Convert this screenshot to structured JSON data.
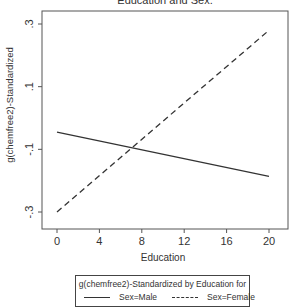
{
  "chart_data": {
    "type": "line",
    "title": "Education and Sex.",
    "xlabel": "Education",
    "ylabel": "g(chemfree2)-Standardized",
    "xlim": [
      -1.2,
      21.8
    ],
    "ylim": [
      -0.355,
      0.34
    ],
    "x_ticks": [
      0,
      4,
      8,
      12,
      16,
      20
    ],
    "x_tick_labels": [
      "0",
      "4",
      "8",
      "12",
      "16",
      "20"
    ],
    "y_ticks": [
      -0.3,
      -0.1,
      0.1,
      0.3
    ],
    "y_tick_labels": [
      "-.3",
      "-.1",
      ".1",
      ".3"
    ],
    "grid": false,
    "legend_position": "bottom",
    "legend_title": "g(chemfree2)-Standardized by Education for",
    "series": [
      {
        "name": "Sex=Male",
        "style": "solid",
        "color": "#333333",
        "x": [
          0,
          20
        ],
        "y": [
          -0.045,
          -0.186
        ]
      },
      {
        "name": "Sex=Female",
        "style": "dashed",
        "color": "#333333",
        "x": [
          0,
          20
        ],
        "y": [
          -0.3,
          0.28
        ]
      }
    ]
  },
  "legend": {
    "title": "g(chemfree2)-Standardized by Education for",
    "items": [
      {
        "label": "Sex=Male",
        "style": "solid"
      },
      {
        "label": "Sex=Female",
        "style": "dashed"
      }
    ]
  }
}
